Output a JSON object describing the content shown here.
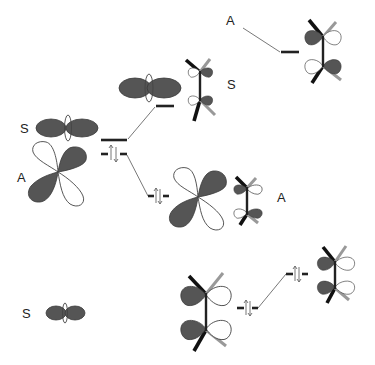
{
  "diagram": {
    "type": "molecular-orbital-interaction-diagram",
    "labels": {
      "top_right": "A",
      "middle_right": "S",
      "left_upper": "S",
      "left_lower": "A",
      "middle_lower_right": "A",
      "bottom_left": "S"
    },
    "levels": [
      {
        "id": "top-right-level",
        "occupied": false
      },
      {
        "id": "upper-middle-level",
        "occupied": false
      },
      {
        "id": "left-upper-level",
        "occupied": false
      },
      {
        "id": "left-lower-level",
        "occupied": true,
        "electrons": 2
      },
      {
        "id": "middle-lower-level",
        "occupied": true,
        "electrons": 2
      },
      {
        "id": "bottom-middle-level",
        "occupied": true,
        "electrons": 2
      },
      {
        "id": "bottom-right-level",
        "occupied": true,
        "electrons": 2
      }
    ],
    "colors": {
      "filled_lobe": "#555555",
      "open_lobe": "#ffffff",
      "bond_dark": "#111111",
      "bond_gray": "#999999",
      "connector": "#555555"
    }
  }
}
